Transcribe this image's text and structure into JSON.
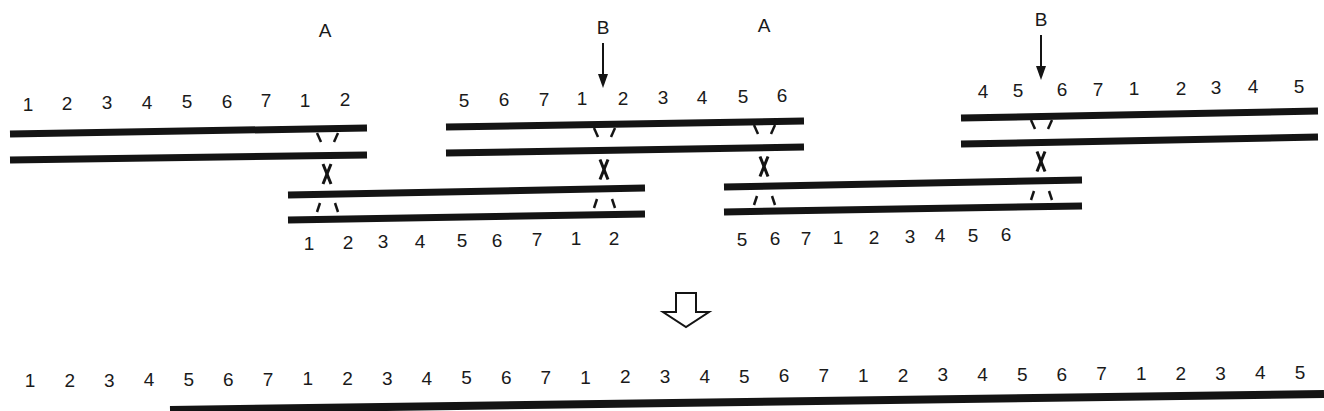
{
  "diagram": {
    "site_labels": [
      {
        "id": "A1",
        "text": "A",
        "x": 325,
        "y": 37
      },
      {
        "id": "B1",
        "text": "B",
        "x": 603,
        "y": 34
      },
      {
        "id": "A2",
        "text": "A",
        "x": 764,
        "y": 32
      },
      {
        "id": "B2",
        "text": "B",
        "x": 1041,
        "y": 26
      }
    ],
    "b_arrows": [
      {
        "x": 603,
        "y1": 43,
        "y2": 88
      },
      {
        "x": 1041,
        "y1": 35,
        "y2": 80
      }
    ],
    "strand_pairs": [
      {
        "id": "pair-1",
        "x1": 10,
        "x2": 367,
        "top": {
          "y_left": 134,
          "y_right": 128
        },
        "bottom": {
          "y_left": 160,
          "y_right": 155
        },
        "labels_position": "above",
        "labels": [
          {
            "t": "1",
            "x": 28,
            "y": 111
          },
          {
            "t": "2",
            "x": 67,
            "y": 110
          },
          {
            "t": "3",
            "x": 107,
            "y": 109
          },
          {
            "t": "4",
            "x": 147,
            "y": 109
          },
          {
            "t": "5",
            "x": 187,
            "y": 108
          },
          {
            "t": "6",
            "x": 227,
            "y": 108
          },
          {
            "t": "7",
            "x": 266,
            "y": 107
          },
          {
            "t": "1",
            "x": 305,
            "y": 107
          },
          {
            "t": "2",
            "x": 345,
            "y": 106
          }
        ]
      },
      {
        "id": "pair-2",
        "x1": 288,
        "x2": 645,
        "top": {
          "y_left": 195,
          "y_right": 188
        },
        "bottom": {
          "y_left": 220,
          "y_right": 214
        },
        "labels_position": "below",
        "labels": [
          {
            "t": "1",
            "x": 309,
            "y": 250
          },
          {
            "t": "2",
            "x": 348,
            "y": 249
          },
          {
            "t": "3",
            "x": 383,
            "y": 248
          },
          {
            "t": "4",
            "x": 420,
            "y": 248
          },
          {
            "t": "5",
            "x": 462,
            "y": 247
          },
          {
            "t": "6",
            "x": 497,
            "y": 247
          },
          {
            "t": "7",
            "x": 537,
            "y": 246
          },
          {
            "t": "1",
            "x": 576,
            "y": 245
          },
          {
            "t": "2",
            "x": 614,
            "y": 245
          }
        ]
      },
      {
        "id": "pair-3",
        "x1": 446,
        "x2": 804,
        "top": {
          "y_left": 127,
          "y_right": 121
        },
        "bottom": {
          "y_left": 153,
          "y_right": 147
        },
        "labels_position": "above",
        "labels": [
          {
            "t": "5",
            "x": 464,
            "y": 107
          },
          {
            "t": "6",
            "x": 504,
            "y": 106
          },
          {
            "t": "7",
            "x": 544,
            "y": 106
          },
          {
            "t": "1",
            "x": 582,
            "y": 105
          },
          {
            "t": "2",
            "x": 623,
            "y": 105
          },
          {
            "t": "3",
            "x": 663,
            "y": 104
          },
          {
            "t": "4",
            "x": 702,
            "y": 104
          },
          {
            "t": "5",
            "x": 743,
            "y": 103
          },
          {
            "t": "6",
            "x": 782,
            "y": 102
          }
        ]
      },
      {
        "id": "pair-4",
        "x1": 724,
        "x2": 1082,
        "top": {
          "y_left": 187,
          "y_right": 180
        },
        "bottom": {
          "y_left": 212,
          "y_right": 206
        },
        "labels_position": "below",
        "labels": [
          {
            "t": "5",
            "x": 742,
            "y": 246
          },
          {
            "t": "6",
            "x": 775,
            "y": 245
          },
          {
            "t": "7",
            "x": 806,
            "y": 245
          },
          {
            "t": "1",
            "x": 838,
            "y": 244
          },
          {
            "t": "2",
            "x": 874,
            "y": 244
          },
          {
            "t": "3",
            "x": 910,
            "y": 243
          },
          {
            "t": "4",
            "x": 940,
            "y": 242
          },
          {
            "t": "5",
            "x": 973,
            "y": 242
          },
          {
            "t": "6",
            "x": 1006,
            "y": 241
          }
        ]
      },
      {
        "id": "pair-5",
        "x1": 961,
        "x2": 1318,
        "top": {
          "y_left": 118,
          "y_right": 111
        },
        "bottom": {
          "y_left": 144,
          "y_right": 137
        },
        "labels_position": "above",
        "labels": [
          {
            "t": "4",
            "x": 983,
            "y": 98
          },
          {
            "t": "5",
            "x": 1018,
            "y": 97
          },
          {
            "t": "6",
            "x": 1062,
            "y": 96
          },
          {
            "t": "7",
            "x": 1098,
            "y": 96
          },
          {
            "t": "1",
            "x": 1134,
            "y": 95
          },
          {
            "t": "2",
            "x": 1181,
            "y": 95
          },
          {
            "t": "3",
            "x": 1216,
            "y": 94
          },
          {
            "t": "4",
            "x": 1253,
            "y": 93
          },
          {
            "t": "5",
            "x": 1299,
            "y": 93
          }
        ]
      }
    ],
    "crossovers": [
      {
        "id": "xo-1",
        "x": 327,
        "y_top_pair_bottom": 155,
        "y_bottom_pair_top": 193
      },
      {
        "id": "xo-2",
        "x": 604,
        "y_top_pair_bottom": 150,
        "y_bottom_pair_top": 189
      },
      {
        "id": "xo-3",
        "x": 764,
        "y_top_pair_bottom": 147,
        "y_bottom_pair_top": 186
      },
      {
        "id": "xo-4",
        "x": 1041,
        "y_top_pair_bottom": 142,
        "y_bottom_pair_top": 181
      }
    ],
    "result_arrow": {
      "x": 686,
      "y_top": 293,
      "y_tip": 327,
      "style": "hollow"
    },
    "result_strand": {
      "x1": 170,
      "x2": 1324,
      "y_left": 410,
      "y_right": 394,
      "labels": [
        "1",
        "2",
        "3",
        "4",
        "5",
        "6",
        "7",
        "1",
        "2",
        "3",
        "4",
        "5",
        "6",
        "7",
        "1",
        "2",
        "3",
        "4",
        "5",
        "6",
        "7",
        "1",
        "2",
        "3",
        "4",
        "5",
        "6",
        "7",
        "1",
        "2",
        "3",
        "4",
        "5"
      ],
      "label_x": [
        30,
        60,
        89,
        116,
        145,
        174,
        205,
        236,
        270,
        300,
        330,
        361,
        389,
        419,
        450,
        478,
        510,
        540,
        566,
        596,
        625,
        655,
        681,
        714,
        744,
        773,
        806,
        834,
        868,
        900,
        931,
        962,
        1000
      ],
      "label_y_left": 367,
      "label_y_right": 376
    }
  }
}
